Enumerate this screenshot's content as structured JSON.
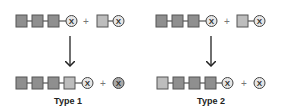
{
  "colors": {
    "square_dark": "#8f8f8f",
    "square_light": "#bdbdbd",
    "square_border": "#555555",
    "circle_light": "#e6e6e6",
    "circle_dark": "#a9a9a9",
    "line": "#333333",
    "arrow": "#222222"
  },
  "symbols": {
    "circle_letter": "X",
    "plus": "+"
  },
  "panels": [
    {
      "label": "Type 1",
      "description": "Donor square attached at the end next to X; released X is filled"
    },
    {
      "label": "Type 2",
      "description": "Donor square attached at the start of the chain; released X is unfilled"
    }
  ]
}
